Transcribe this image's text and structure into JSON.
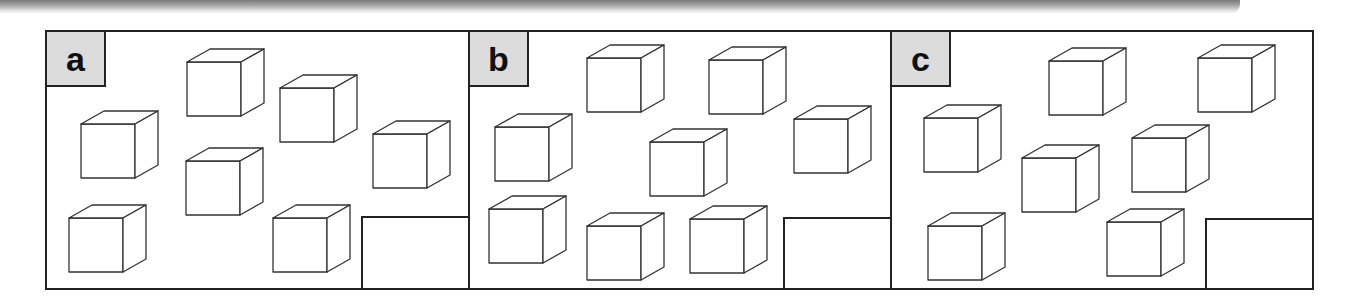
{
  "panels": [
    {
      "label": "a",
      "left": 45,
      "width": 425,
      "answer_box": {
        "left": 361,
        "top": 216
      },
      "cube_count": 7,
      "cubes": [
        {
          "x": 187,
          "y": 62
        },
        {
          "x": 280,
          "y": 88
        },
        {
          "x": 81,
          "y": 124
        },
        {
          "x": 186,
          "y": 161
        },
        {
          "x": 373,
          "y": 134
        },
        {
          "x": 69,
          "y": 218
        },
        {
          "x": 273,
          "y": 218
        }
      ]
    },
    {
      "label": "b",
      "left": 468,
      "width": 424,
      "answer_box": {
        "left": 783,
        "top": 217
      },
      "cube_count": 8,
      "cubes": [
        {
          "x": 587,
          "y": 58
        },
        {
          "x": 709,
          "y": 60
        },
        {
          "x": 495,
          "y": 127
        },
        {
          "x": 650,
          "y": 142
        },
        {
          "x": 794,
          "y": 119
        },
        {
          "x": 489,
          "y": 209
        },
        {
          "x": 587,
          "y": 226
        },
        {
          "x": 690,
          "y": 219
        }
      ]
    },
    {
      "label": "c",
      "left": 890,
      "width": 424,
      "answer_box": {
        "left": 1205,
        "top": 218
      },
      "cube_count": 7,
      "cubes": [
        {
          "x": 1049,
          "y": 61
        },
        {
          "x": 1198,
          "y": 58
        },
        {
          "x": 924,
          "y": 118
        },
        {
          "x": 1022,
          "y": 158
        },
        {
          "x": 1132,
          "y": 138
        },
        {
          "x": 928,
          "y": 226
        },
        {
          "x": 1107,
          "y": 222
        }
      ]
    }
  ],
  "cube_style": {
    "face": 54,
    "depth_dx": 23,
    "depth_dy": 13,
    "stroke": "#333333",
    "fill": "#ffffff"
  },
  "colors": {
    "border": "#222222",
    "label_bg": "#dcdcdc"
  }
}
